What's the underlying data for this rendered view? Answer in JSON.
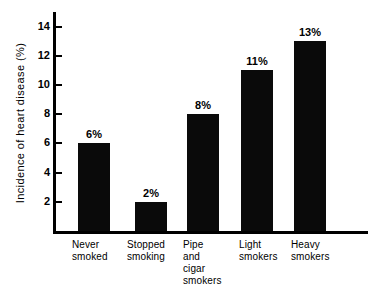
{
  "chart_data": {
    "type": "bar",
    "title": "",
    "xlabel": "",
    "ylabel": "Incidence of heart disease (%)",
    "categories": [
      "Never\nsmoked",
      "Stopped\nsmoking",
      "Pipe\nand\ncigar\nsmokers",
      "Light\nsmokers",
      "Heavy\nsmokers"
    ],
    "values": [
      6,
      2,
      8,
      11,
      13
    ],
    "value_labels": [
      "6%",
      "2%",
      "8%",
      "11%",
      "13%"
    ],
    "ylim": [
      0,
      15
    ],
    "yticks": [
      2,
      4,
      6,
      8,
      10,
      12,
      14
    ],
    "ytick_labels": [
      "2",
      "4",
      "6",
      "8",
      "10",
      "12",
      "14"
    ],
    "grid": false,
    "legend": false,
    "bar_color": "#0a0a0a",
    "axis_color": "#000000",
    "background_color": "#ffffff"
  }
}
